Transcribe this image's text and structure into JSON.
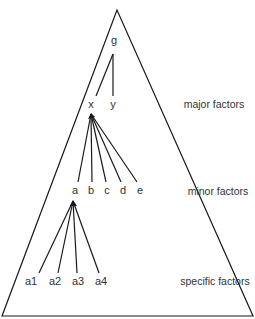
{
  "diagram": {
    "type": "hierarchical factor model",
    "root": {
      "label": "g"
    },
    "level_labels": {
      "major": "major factors",
      "minor": "minor factors",
      "specific": "specific factors"
    },
    "major_factors": [
      {
        "label": "x"
      },
      {
        "label": "y"
      }
    ],
    "minor_factors": [
      {
        "label": "a"
      },
      {
        "label": "b"
      },
      {
        "label": "c"
      },
      {
        "label": "d"
      },
      {
        "label": "e"
      }
    ],
    "specific_factors": [
      {
        "label": "a1"
      },
      {
        "label": "a2"
      },
      {
        "label": "a3"
      },
      {
        "label": "a4"
      }
    ],
    "edges": [
      [
        "g",
        "x"
      ],
      [
        "g",
        "y"
      ],
      [
        "x",
        "a"
      ],
      [
        "x",
        "b"
      ],
      [
        "x",
        "c"
      ],
      [
        "x",
        "d"
      ],
      [
        "x",
        "e"
      ],
      [
        "a",
        "a1"
      ],
      [
        "a",
        "a2"
      ],
      [
        "a",
        "a3"
      ],
      [
        "a",
        "a4"
      ]
    ],
    "line_color": "#1a1a1a",
    "text_color": "#333333"
  }
}
